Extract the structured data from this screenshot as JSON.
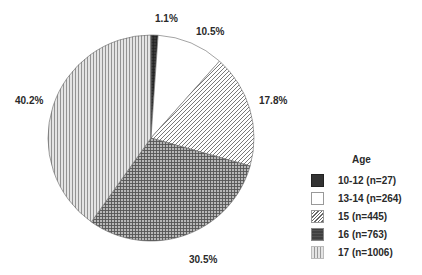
{
  "chart_data": {
    "type": "pie",
    "title": "",
    "legend_title": "Age",
    "legend_position": "right",
    "categories": [
      "10-12 (n=27)",
      "13-14 (n=264)",
      "15 (n=445)",
      "16 (n=763)",
      "17 (n=1006)"
    ],
    "values": [
      1.1,
      10.5,
      17.8,
      30.5,
      40.2
    ],
    "counts": [
      27,
      264,
      445,
      763,
      1006
    ],
    "labels": [
      "1.1%",
      "10.5%",
      "17.8%",
      "30.5%",
      "40.2%"
    ],
    "patterns": [
      "dark-crosshatch",
      "white",
      "diagonal-hatch",
      "gray-crosshatch",
      "vertical-lines"
    ]
  },
  "legend": {
    "title": "Age",
    "items": [
      {
        "label": "10-12 (n=27)"
      },
      {
        "label": "13-14 (n=264)"
      },
      {
        "label": "15 (n=445)"
      },
      {
        "label": "16 (n=763)"
      },
      {
        "label": "17 (n=1006)"
      }
    ]
  },
  "slice_labels": [
    "1.1%",
    "10.5%",
    "17.8%",
    "30.5%",
    "40.2%"
  ]
}
